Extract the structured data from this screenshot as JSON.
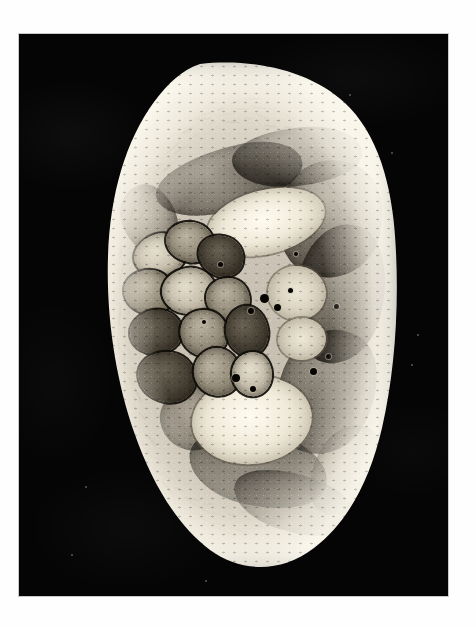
{
  "figure": {
    "kind": "anatomical-cross-section-photograph",
    "caption": "",
    "plate": {
      "background_color": "#050505",
      "border_color": "#c9c9c9",
      "page_background": "#ffffff"
    },
    "specimen": {
      "name": "tissue cross-section",
      "orientation": "flat margin at left, convex bulge at right",
      "base_tissue_color": "#c6bfb2",
      "subcutaneous_rim_color": "#f0ece0",
      "muscle_color": "#3a362e",
      "bone_marrow_color": "#f7f4ea",
      "vessel_color": "#0d0b08",
      "lobule_outline_color": "#16130f"
    },
    "structures": [
      {
        "label": "superficial fascia and subcutaneous fat",
        "region": "outer rim",
        "tone": "pale"
      },
      {
        "label": "superior muscle group",
        "region": "upper",
        "tone": "dark"
      },
      {
        "label": "bone with marrow cavity",
        "region": "upper central",
        "tone": "bright"
      },
      {
        "label": "lobulated glandular cluster",
        "region": "left central",
        "tone": "outlined"
      },
      {
        "label": "deep muscle mass",
        "region": "right",
        "tone": "dark"
      },
      {
        "label": "second bone / marrow region",
        "region": "lower central",
        "tone": "bright"
      },
      {
        "label": "inferior muscle group",
        "region": "lower",
        "tone": "dark"
      },
      {
        "label": "neurovascular bundle",
        "region": "central",
        "tone": "vessels"
      }
    ],
    "muscles": [
      {
        "x": 72,
        "y": 92,
        "w": 150,
        "h": 62,
        "rot": -16,
        "tone": "dark"
      },
      {
        "x": 150,
        "y": 72,
        "w": 130,
        "h": 58,
        "rot": -6,
        "tone": "dark"
      },
      {
        "x": 196,
        "y": 104,
        "w": 104,
        "h": 118,
        "rot": 14,
        "tone": "dark"
      },
      {
        "x": 214,
        "y": 168,
        "w": 88,
        "h": 140,
        "rot": 10,
        "tone": "dark"
      },
      {
        "x": 40,
        "y": 128,
        "w": 54,
        "h": 70,
        "rot": -22,
        "tone": "light"
      },
      {
        "x": 196,
        "y": 272,
        "w": 96,
        "h": 128,
        "rot": 22,
        "tone": "dark"
      },
      {
        "x": 106,
        "y": 376,
        "w": 140,
        "h": 74,
        "rot": 12,
        "tone": "dark"
      },
      {
        "x": 78,
        "y": 330,
        "w": 72,
        "h": 64,
        "rot": -10,
        "tone": "light"
      },
      {
        "x": 150,
        "y": 418,
        "w": 124,
        "h": 58,
        "rot": 16,
        "tone": "dark"
      },
      {
        "x": 232,
        "y": 366,
        "w": 62,
        "h": 96,
        "rot": 28,
        "tone": "light"
      }
    ],
    "bones": [
      {
        "x": 124,
        "y": 134,
        "w": 120,
        "h": 64,
        "rot": -14,
        "tone": "bright"
      },
      {
        "x": 110,
        "y": 320,
        "w": 120,
        "h": 88,
        "rot": -6,
        "tone": "bright"
      },
      {
        "x": 186,
        "y": 210,
        "w": 58,
        "h": 54,
        "rot": 8,
        "tone": "dim"
      },
      {
        "x": 196,
        "y": 262,
        "w": 48,
        "h": 42,
        "rot": -4,
        "tone": "dim"
      }
    ],
    "lobules": [
      {
        "x": 52,
        "y": 178,
        "w": 52,
        "h": 42,
        "rot": -18,
        "tone": "pale"
      },
      {
        "x": 84,
        "y": 166,
        "w": 48,
        "h": 40,
        "rot": 8,
        "tone": "normal"
      },
      {
        "x": 116,
        "y": 180,
        "w": 46,
        "h": 40,
        "rot": 22,
        "tone": "dark"
      },
      {
        "x": 42,
        "y": 214,
        "w": 50,
        "h": 44,
        "rot": 4,
        "tone": "normal"
      },
      {
        "x": 80,
        "y": 212,
        "w": 54,
        "h": 46,
        "rot": -8,
        "tone": "pale"
      },
      {
        "x": 124,
        "y": 222,
        "w": 44,
        "h": 42,
        "rot": 12,
        "tone": "normal"
      },
      {
        "x": 48,
        "y": 254,
        "w": 52,
        "h": 44,
        "rot": -12,
        "tone": "dark"
      },
      {
        "x": 98,
        "y": 254,
        "w": 48,
        "h": 46,
        "rot": 16,
        "tone": "normal"
      },
      {
        "x": 144,
        "y": 250,
        "w": 42,
        "h": 50,
        "rot": -6,
        "tone": "dark"
      },
      {
        "x": 56,
        "y": 296,
        "w": 58,
        "h": 50,
        "rot": 10,
        "tone": "dark"
      },
      {
        "x": 112,
        "y": 292,
        "w": 46,
        "h": 48,
        "rot": -14,
        "tone": "normal"
      },
      {
        "x": 150,
        "y": 296,
        "w": 40,
        "h": 44,
        "rot": 6,
        "tone": "pale"
      }
    ],
    "vessels": [
      {
        "x": 178,
        "y": 238,
        "d": 9
      },
      {
        "x": 192,
        "y": 248,
        "d": 7
      },
      {
        "x": 166,
        "y": 252,
        "d": 6
      },
      {
        "x": 206,
        "y": 232,
        "d": 5
      },
      {
        "x": 150,
        "y": 318,
        "d": 8
      },
      {
        "x": 168,
        "y": 330,
        "d": 6
      },
      {
        "x": 228,
        "y": 312,
        "d": 7
      },
      {
        "x": 244,
        "y": 298,
        "d": 5
      },
      {
        "x": 136,
        "y": 206,
        "d": 5
      },
      {
        "x": 120,
        "y": 264,
        "d": 4
      },
      {
        "x": 212,
        "y": 196,
        "d": 4
      },
      {
        "x": 252,
        "y": 248,
        "d": 5
      }
    ],
    "plate_specks": [
      {
        "x": 330,
        "y": 60,
        "d": 2
      },
      {
        "x": 372,
        "y": 118,
        "d": 2
      },
      {
        "x": 398,
        "y": 300,
        "d": 2
      },
      {
        "x": 392,
        "y": 330,
        "d": 2
      },
      {
        "x": 66,
        "y": 452,
        "d": 2
      },
      {
        "x": 52,
        "y": 520,
        "d": 2
      },
      {
        "x": 186,
        "y": 546,
        "d": 2
      }
    ]
  }
}
